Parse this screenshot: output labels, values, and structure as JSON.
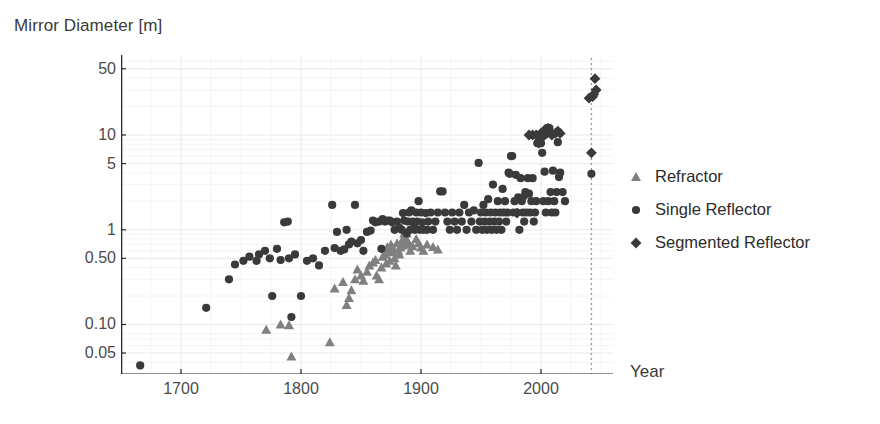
{
  "chart_data": {
    "type": "scatter",
    "title": "",
    "xlabel": "Year",
    "ylabel": "Mirror Diameter [m]",
    "yscale": "log",
    "xlim": [
      1650,
      2060
    ],
    "ylim": [
      0.03,
      70
    ],
    "grid": true,
    "legend_position": "right",
    "xticks": [
      1700,
      1800,
      1900,
      2000
    ],
    "xtick_labels": [
      "1700",
      "1800",
      "1900",
      "2000"
    ],
    "yticks": [
      0.05,
      0.1,
      0.5,
      1,
      5,
      10,
      50
    ],
    "ytick_labels": [
      "0.05",
      "0.10",
      "0.50",
      "1",
      "5",
      "10",
      "50"
    ],
    "annotations": [
      {
        "name": "future-marker",
        "type": "vline",
        "x": 2042,
        "style": "dotted",
        "color": "#9a9a9a"
      }
    ],
    "series": [
      {
        "name": "Refractor",
        "marker": "triangle",
        "color": "#808080",
        "points": [
          [
            1771,
            0.088
          ],
          [
            1783,
            0.1
          ],
          [
            1790,
            0.098
          ],
          [
            1792,
            0.046
          ],
          [
            1824,
            0.065
          ],
          [
            1828,
            0.24
          ],
          [
            1835,
            0.28
          ],
          [
            1838,
            0.16
          ],
          [
            1840,
            0.19
          ],
          [
            1842,
            0.23
          ],
          [
            1845,
            0.3
          ],
          [
            1847,
            0.38
          ],
          [
            1850,
            0.33
          ],
          [
            1852,
            0.29
          ],
          [
            1855,
            0.36
          ],
          [
            1857,
            0.42
          ],
          [
            1860,
            0.45
          ],
          [
            1862,
            0.48
          ],
          [
            1863,
            0.33
          ],
          [
            1865,
            0.3
          ],
          [
            1867,
            0.4
          ],
          [
            1868,
            0.52
          ],
          [
            1870,
            0.55
          ],
          [
            1871,
            0.44
          ],
          [
            1872,
            0.66
          ],
          [
            1873,
            0.6
          ],
          [
            1874,
            0.47
          ],
          [
            1875,
            0.7
          ],
          [
            1876,
            0.58
          ],
          [
            1877,
            0.63
          ],
          [
            1878,
            0.5
          ],
          [
            1879,
            0.42
          ],
          [
            1880,
            0.72
          ],
          [
            1881,
            0.6
          ],
          [
            1882,
            0.55
          ],
          [
            1883,
            0.65
          ],
          [
            1884,
            0.76
          ],
          [
            1885,
            0.68
          ],
          [
            1886,
            0.91
          ],
          [
            1887,
            0.8
          ],
          [
            1888,
            0.91
          ],
          [
            1889,
            0.75
          ],
          [
            1890,
            0.7
          ],
          [
            1891,
            0.6
          ],
          [
            1893,
            0.67
          ],
          [
            1895,
            1.02
          ],
          [
            1896,
            0.8
          ],
          [
            1897,
            1.02
          ],
          [
            1898,
            0.72
          ],
          [
            1900,
            0.65
          ],
          [
            1902,
            0.6
          ],
          [
            1905,
            0.7
          ],
          [
            1910,
            0.66
          ],
          [
            1914,
            0.62
          ]
        ]
      },
      {
        "name": "Single Reflector",
        "marker": "circle",
        "color": "#3a3a3a",
        "points": [
          [
            1666,
            0.037
          ],
          [
            1721,
            0.15
          ],
          [
            1740,
            0.3
          ],
          [
            1745,
            0.43
          ],
          [
            1752,
            0.47
          ],
          [
            1757,
            0.52
          ],
          [
            1763,
            0.47
          ],
          [
            1765,
            0.55
          ],
          [
            1770,
            0.6
          ],
          [
            1774,
            0.5
          ],
          [
            1776,
            0.2
          ],
          [
            1780,
            0.63
          ],
          [
            1783,
            0.48
          ],
          [
            1786,
            1.2
          ],
          [
            1789,
            1.22
          ],
          [
            1790,
            0.5
          ],
          [
            1792,
            0.12
          ],
          [
            1795,
            0.55
          ],
          [
            1800,
            0.2
          ],
          [
            1805,
            0.47
          ],
          [
            1810,
            0.5
          ],
          [
            1815,
            0.42
          ],
          [
            1820,
            0.6
          ],
          [
            1826,
            1.83
          ],
          [
            1828,
            0.64
          ],
          [
            1830,
            0.95
          ],
          [
            1833,
            0.6
          ],
          [
            1836,
            0.62
          ],
          [
            1838,
            1.0
          ],
          [
            1840,
            0.7
          ],
          [
            1842,
            0.75
          ],
          [
            1845,
            1.83
          ],
          [
            1847,
            0.72
          ],
          [
            1850,
            0.78
          ],
          [
            1852,
            0.6
          ],
          [
            1855,
            0.95
          ],
          [
            1858,
            0.98
          ],
          [
            1860,
            1.25
          ],
          [
            1862,
            1.2
          ],
          [
            1865,
            1.22
          ],
          [
            1867,
            0.63
          ],
          [
            1868,
            1.3
          ],
          [
            1870,
            1.22
          ],
          [
            1872,
            1.25
          ],
          [
            1874,
            1.25
          ],
          [
            1876,
            1.2
          ],
          [
            1878,
            1.0
          ],
          [
            1880,
            1.22
          ],
          [
            1882,
            1.05
          ],
          [
            1884,
            1.0
          ],
          [
            1885,
            1.5
          ],
          [
            1886,
            1.25
          ],
          [
            1888,
            0.91
          ],
          [
            1889,
            1.22
          ],
          [
            1890,
            1.52
          ],
          [
            1891,
            1.0
          ],
          [
            1892,
            1.6
          ],
          [
            1893,
            1.22
          ],
          [
            1894,
            1.05
          ],
          [
            1895,
            1.0
          ],
          [
            1896,
            1.52
          ],
          [
            1897,
            1.22
          ],
          [
            1898,
            2.0
          ],
          [
            1899,
            1.0
          ],
          [
            1900,
            1.52
          ],
          [
            1901,
            1.2
          ],
          [
            1902,
            1.0
          ],
          [
            1904,
            1.5
          ],
          [
            1905,
            1.0
          ],
          [
            1906,
            1.22
          ],
          [
            1908,
            1.52
          ],
          [
            1910,
            1.0
          ],
          [
            1912,
            1.22
          ],
          [
            1914,
            1.52
          ],
          [
            1916,
            2.54
          ],
          [
            1918,
            2.54
          ],
          [
            1920,
            1.52
          ],
          [
            1922,
            1.22
          ],
          [
            1924,
            1.0
          ],
          [
            1926,
            1.52
          ],
          [
            1928,
            1.22
          ],
          [
            1930,
            1.0
          ],
          [
            1932,
            1.52
          ],
          [
            1934,
            1.22
          ],
          [
            1936,
            1.83
          ],
          [
            1938,
            1.0
          ],
          [
            1940,
            1.52
          ],
          [
            1942,
            1.22
          ],
          [
            1944,
            1.6
          ],
          [
            1946,
            1.0
          ],
          [
            1948,
            5.08
          ],
          [
            1949,
            1.22
          ],
          [
            1950,
            1.52
          ],
          [
            1951,
            1.0
          ],
          [
            1952,
            1.83
          ],
          [
            1953,
            1.22
          ],
          [
            1954,
            1.52
          ],
          [
            1955,
            1.0
          ],
          [
            1956,
            2.1
          ],
          [
            1957,
            1.22
          ],
          [
            1958,
            1.52
          ],
          [
            1959,
            1.0
          ],
          [
            1960,
            3.0
          ],
          [
            1961,
            1.22
          ],
          [
            1962,
            1.52
          ],
          [
            1963,
            1.0
          ],
          [
            1964,
            2.0
          ],
          [
            1965,
            1.22
          ],
          [
            1966,
            1.52
          ],
          [
            1967,
            1.0
          ],
          [
            1968,
            2.7
          ],
          [
            1969,
            1.52
          ],
          [
            1970,
            2.0
          ],
          [
            1971,
            1.22
          ],
          [
            1972,
            1.52
          ],
          [
            1973,
            4.0
          ],
          [
            1974,
            3.9
          ],
          [
            1975,
            6.0
          ],
          [
            1976,
            6.0
          ],
          [
            1977,
            1.52
          ],
          [
            1978,
            2.0
          ],
          [
            1979,
            3.8
          ],
          [
            1980,
            1.52
          ],
          [
            1981,
            2.2
          ],
          [
            1982,
            1.0
          ],
          [
            1983,
            3.5
          ],
          [
            1984,
            2.0
          ],
          [
            1985,
            1.52
          ],
          [
            1986,
            1.22
          ],
          [
            1987,
            2.5
          ],
          [
            1988,
            1.52
          ],
          [
            1989,
            3.5
          ],
          [
            1990,
            2.4
          ],
          [
            1991,
            1.52
          ],
          [
            1992,
            2.0
          ],
          [
            1993,
            3.5
          ],
          [
            1994,
            1.22
          ],
          [
            1995,
            1.52
          ],
          [
            1996,
            2.0
          ],
          [
            1997,
            8.2
          ],
          [
            1998,
            8.2
          ],
          [
            1999,
            8.2
          ],
          [
            2000,
            8.2
          ],
          [
            2001,
            6.5
          ],
          [
            2002,
            2.0
          ],
          [
            2003,
            4.1
          ],
          [
            2004,
            1.52
          ],
          [
            2005,
            11.8
          ],
          [
            2006,
            2.0
          ],
          [
            2007,
            11.8
          ],
          [
            2008,
            2.5
          ],
          [
            2009,
            1.52
          ],
          [
            2010,
            4.2
          ],
          [
            2011,
            2.0
          ],
          [
            2012,
            1.52
          ],
          [
            2013,
            2.5
          ],
          [
            2014,
            8.4
          ],
          [
            2015,
            3.6
          ],
          [
            2016,
            4.0
          ],
          [
            2018,
            2.5
          ],
          [
            2020,
            2.0
          ],
          [
            2042,
            3.9
          ]
        ]
      },
      {
        "name": "Segmented Reflector",
        "marker": "diamond",
        "color": "#3a3a3a",
        "points": [
          [
            1980,
            1.5
          ],
          [
            1985,
            2.2
          ],
          [
            1990,
            10.0
          ],
          [
            1993,
            10.0
          ],
          [
            1996,
            10.0
          ],
          [
            1998,
            8.2
          ],
          [
            1999,
            9.2
          ],
          [
            2000,
            10.4
          ],
          [
            2001,
            10.4
          ],
          [
            2002,
            11.0
          ],
          [
            2003,
            10.0
          ],
          [
            2005,
            10.4
          ],
          [
            2006,
            11.8
          ],
          [
            2008,
            10.4
          ],
          [
            2009,
            10.0
          ],
          [
            2012,
            10.4
          ],
          [
            2014,
            11.0
          ],
          [
            2016,
            10.4
          ],
          [
            2042,
            6.5
          ],
          [
            2040,
            24.5
          ],
          [
            2043,
            25.4
          ],
          [
            2045,
            39.3
          ],
          [
            2046,
            30.0
          ],
          [
            2044,
            27.0
          ]
        ]
      }
    ]
  },
  "legend": {
    "items": [
      {
        "label": "Refractor",
        "marker": "triangle",
        "color": "#808080"
      },
      {
        "label": "Single Reflector",
        "marker": "circle",
        "color": "#3a3a3a"
      },
      {
        "label": "Segmented Reflector",
        "marker": "diamond",
        "color": "#3a3a3a"
      }
    ]
  },
  "axis": {
    "y_caption": "Mirror Diameter [m]",
    "x_caption": "Year"
  }
}
